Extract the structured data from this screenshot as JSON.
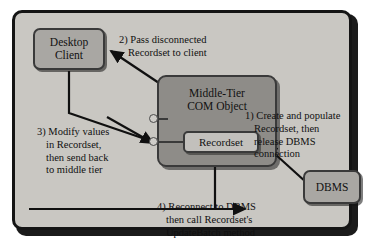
{
  "diagram": {
    "nodes": {
      "desktop_client": {
        "line1": "Desktop",
        "line2": "Client"
      },
      "middle_tier": {
        "line1": "Middle-Tier",
        "line2": "COM Object"
      },
      "recordset": {
        "label": "Recordset"
      },
      "dbms": {
        "label": "DBMS"
      }
    },
    "steps": [
      {
        "id": "step-1",
        "number": "1)",
        "lines": [
          "1) Create and populate",
          "Recordset, then",
          "release DBMS",
          "connection"
        ]
      },
      {
        "id": "step-2",
        "number": "2)",
        "lines": [
          "2) Pass disconnected",
          "Recordset to client"
        ]
      },
      {
        "id": "step-3",
        "number": "3)",
        "lines": [
          "3) Modify values",
          "in Recordset,",
          "then send back",
          "to middle tier"
        ]
      },
      {
        "id": "step-4",
        "number": "4)",
        "lines": [
          "4) Reconnect to DBMS",
          "then call Recordset's",
          "UpdateBatch method"
        ]
      }
    ],
    "colors": {
      "panel_background": "#c9c7c2",
      "node_fill": "#a9a7a3",
      "com_fill": "#8e8c88",
      "recordset_fill": "#c2c0bc",
      "border": "#141414",
      "text": "#101010"
    }
  }
}
